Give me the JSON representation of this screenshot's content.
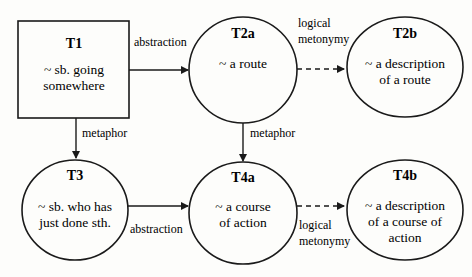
{
  "nodes": {
    "t1": {
      "title": "T1",
      "lines": [
        "~ sb. going",
        "somewhere"
      ],
      "shape": "rectangle"
    },
    "t2a": {
      "title": "T2a",
      "lines": [
        "~ a route"
      ],
      "shape": "ellipse"
    },
    "t2b": {
      "title": "T2b",
      "lines": [
        "~ a description",
        "of a route"
      ],
      "shape": "ellipse"
    },
    "t3": {
      "title": "T3",
      "lines": [
        "~ sb. who has",
        "just done sth."
      ],
      "shape": "ellipse"
    },
    "t4a": {
      "title": "T4a",
      "lines": [
        "~ a course",
        "of action"
      ],
      "shape": "ellipse"
    },
    "t4b": {
      "title": "T4b",
      "lines": [
        "~ a description",
        "of a course of",
        "action"
      ],
      "shape": "ellipse"
    }
  },
  "edges": {
    "t1_t2a": {
      "label": "abstraction",
      "style": "solid"
    },
    "t2a_t2b": {
      "label_lines": [
        "logical",
        "metonymy"
      ],
      "style": "dashed"
    },
    "t1_t3": {
      "label": "metaphor",
      "style": "solid"
    },
    "t2a_t4a": {
      "label": "metaphor",
      "style": "solid"
    },
    "t3_t4a": {
      "label": "abstraction",
      "style": "solid"
    },
    "t4a_t4b": {
      "label_lines": [
        "logical",
        "metonymy"
      ],
      "style": "dashed"
    }
  },
  "colors": {
    "stroke": "#1a1a1a",
    "background": "#fdfdfb"
  }
}
